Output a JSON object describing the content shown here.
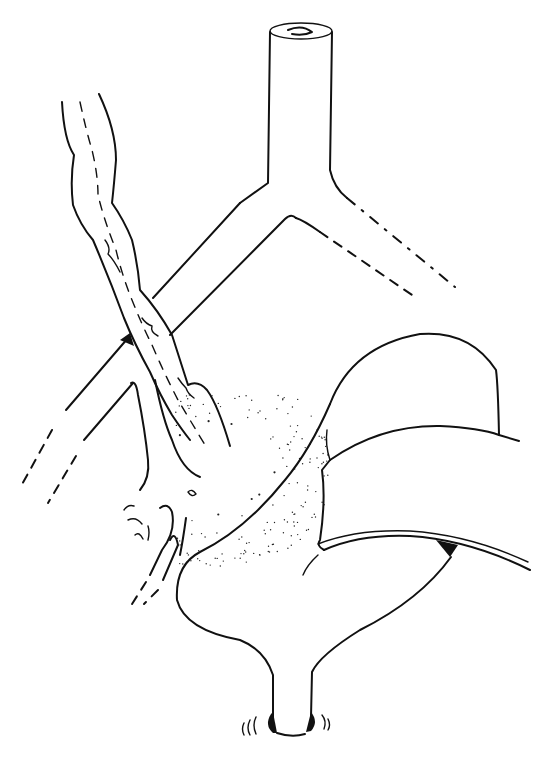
{
  "figure": {
    "title": "",
    "style": "black-and-white line illustration",
    "colors": {
      "ink": "#111111",
      "background": "#ffffff"
    },
    "parts": [
      {
        "id": "vertical-tube",
        "description": "vertical tubular structure with open lumen at top"
      },
      {
        "id": "bifurcation",
        "description": "Y-shaped branching of tube into left and right branches"
      },
      {
        "id": "right-branch",
        "description": "right branch fading to dashed lines"
      },
      {
        "id": "left-branch",
        "description": "left branch fading to dashed lines"
      },
      {
        "id": "tortuous-vessel",
        "description": "tortuous vessel with inner dashed wavy lines crossing the left branch"
      },
      {
        "id": "lower-branching-vessel",
        "description": "branching vessel with small tributaries"
      },
      {
        "id": "stippled-extravasation",
        "description": "stippled dotted area of leakage"
      },
      {
        "id": "folded-organ",
        "description": "curved folded organ with overlapping flap"
      },
      {
        "id": "sac-with-neck",
        "description": "rounded sac tapering to a narrow neck at bottom"
      }
    ]
  }
}
